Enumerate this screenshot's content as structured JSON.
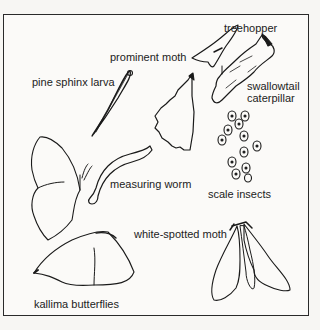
{
  "figure": {
    "labels": {
      "treehopper": "treehopper",
      "prominent_moth": "prominent moth",
      "pine_sphinx_larva": "pine sphinx larva",
      "swallowtail_caterpillar_line1": "swallowtail",
      "swallowtail_caterpillar_line2": "caterpillar",
      "measuring_worm": "measuring worm",
      "scale_insects": "scale insects",
      "white_spotted_moth": "white-spotted moth",
      "kallima_butterflies": "kallima butterflies"
    },
    "colors": {
      "ink": "#1a1a1a",
      "paper": "#fbfaf8",
      "border": "#2a2a2a"
    }
  }
}
